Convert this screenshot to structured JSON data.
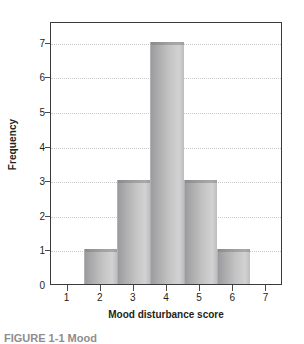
{
  "chart_data": {
    "type": "bar",
    "title": "",
    "xlabel": "Mood disturbance score",
    "ylabel": "Frequency",
    "categories": [
      "2",
      "3",
      "4",
      "5",
      "6"
    ],
    "values": [
      1,
      3,
      7,
      3,
      1
    ],
    "bar_centers": [
      2,
      3,
      4,
      5,
      6
    ],
    "bar_width": 1,
    "x_range": [
      0.5,
      7.5
    ],
    "xlim": [
      0.5,
      7.5
    ],
    "ylim": [
      0,
      7.6
    ],
    "x_ticks": [
      1,
      2,
      3,
      4,
      5,
      6,
      7
    ],
    "x_ticklabels": [
      "1",
      "2",
      "3",
      "4",
      "5",
      "6",
      "7"
    ],
    "y_ticks": [
      0,
      1,
      2,
      3,
      4,
      5,
      6,
      7
    ],
    "y_ticklabels": [
      "0",
      "1",
      "2",
      "3",
      "4",
      "5",
      "6",
      "7"
    ],
    "grid": "horizontal-dotted",
    "legend": null,
    "colors": {
      "bar_dark": "#9b9b9d",
      "bar_light": "#d2d2d3",
      "frame": "#3b3b3d",
      "gridline": "#c9c9cb",
      "text": "#231f20"
    }
  },
  "caption": {
    "text": "FIGURE 1-1 Mood"
  }
}
